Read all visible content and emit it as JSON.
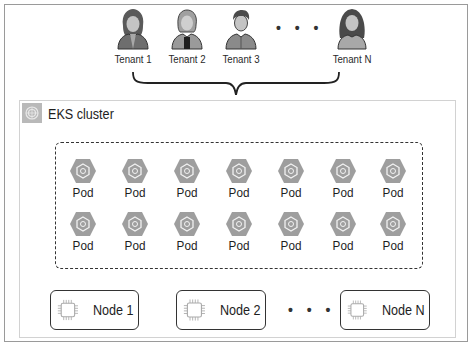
{
  "tenants": [
    {
      "label": "Tenant 1",
      "icon": "user-female-icon"
    },
    {
      "label": "Tenant 2",
      "icon": "user-female-icon"
    },
    {
      "label": "Tenant 3",
      "icon": "user-male-icon"
    },
    {
      "label": "Tenant N",
      "icon": "user-female-long-hair-icon"
    }
  ],
  "tenants_ellipsis": "• • •",
  "cluster": {
    "title": "EKS cluster",
    "icon": "eks-cluster-icon"
  },
  "pods": {
    "rows": 2,
    "columns": 7,
    "label": "Pod",
    "icon": "pod-hexagon-icon",
    "items": [
      {
        "label": "Pod"
      },
      {
        "label": "Pod"
      },
      {
        "label": "Pod"
      },
      {
        "label": "Pod"
      },
      {
        "label": "Pod"
      },
      {
        "label": "Pod"
      },
      {
        "label": "Pod"
      },
      {
        "label": "Pod"
      },
      {
        "label": "Pod"
      },
      {
        "label": "Pod"
      },
      {
        "label": "Pod"
      },
      {
        "label": "Pod"
      },
      {
        "label": "Pod"
      },
      {
        "label": "Pod"
      }
    ]
  },
  "nodes": [
    {
      "label": "Node 1",
      "icon": "chip-icon"
    },
    {
      "label": "Node 2",
      "icon": "chip-icon"
    },
    {
      "label": "Node N",
      "icon": "chip-icon"
    }
  ],
  "nodes_ellipsis": "• • •",
  "colors": {
    "frame_border": "#9a9a9a",
    "cluster_border": "#d2d2d2",
    "pod_fill": "#9e9e9e",
    "chip_stroke": "#aaaaaa",
    "text": "#1e1e1e"
  }
}
